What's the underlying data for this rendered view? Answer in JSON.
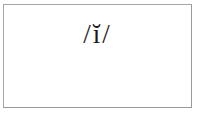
{
  "page": {
    "background_color": "#ffffff",
    "width": 199,
    "height": 121
  },
  "frame": {
    "name": "content-frame",
    "border_color": "#a6a6a6",
    "background_color": "#ffffff",
    "border_width_px": 1
  },
  "content": {
    "transcription": "/ĭ/",
    "text_color": "#1a1a1a",
    "font_style": "serif",
    "font_size_px": 27,
    "components": {
      "opening_slash": "/",
      "phoneme": "ĭ",
      "base_letter": "i",
      "diacritic": "breve",
      "diacritic_glyph": "˘",
      "closing_slash": "/"
    }
  }
}
